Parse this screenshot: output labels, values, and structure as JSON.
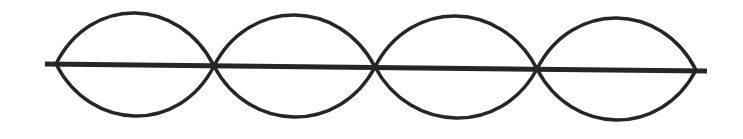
{
  "diagram": {
    "type": "standing-wave",
    "loops": 4,
    "nodes": 5,
    "colors": {
      "stroke": "#262626",
      "background": "#ffffff"
    },
    "axis_line": {
      "x1": 45,
      "y1": 64,
      "x2": 707,
      "y2": 71
    },
    "node_positions": [
      {
        "x": 56,
        "y": 64
      },
      {
        "x": 214,
        "y": 66
      },
      {
        "x": 375,
        "y": 67
      },
      {
        "x": 537,
        "y": 69
      },
      {
        "x": 696,
        "y": 70
      }
    ],
    "loop_extents": [
      {
        "top": 13,
        "bottom": 116
      },
      {
        "top": 15,
        "bottom": 117
      },
      {
        "top": 16,
        "bottom": 118
      },
      {
        "top": 18,
        "bottom": 120
      }
    ]
  }
}
